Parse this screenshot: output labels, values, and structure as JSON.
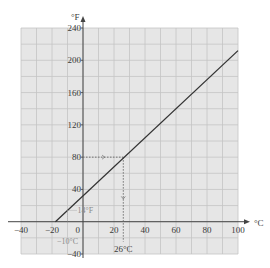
{
  "chart_data": {
    "type": "line",
    "title": "",
    "xlabel": "°C",
    "ylabel": "°F",
    "xlim": [
      -40,
      100
    ],
    "ylim": [
      -40,
      240
    ],
    "grid": true,
    "x_ticks": [
      -40,
      -20,
      0,
      20,
      40,
      60,
      80,
      100
    ],
    "y_ticks": [
      -40,
      40,
      80,
      120,
      160,
      200,
      240
    ],
    "x_tick_labels": [
      "−40",
      "−20",
      "0",
      "20",
      "40",
      "60",
      "80",
      "100"
    ],
    "y_tick_labels": [
      "−40",
      "40",
      "80",
      "120",
      "160",
      "200",
      "240"
    ],
    "series": [
      {
        "name": "Fahrenheit vs Celsius",
        "x": [
          -17.8,
          0,
          26,
          100
        ],
        "y": [
          0,
          32,
          80,
          212
        ]
      }
    ],
    "annotations": [
      {
        "text": "−10°C",
        "x": -10,
        "y": 0
      },
      {
        "text": "14°F",
        "x": -10,
        "y": 14
      },
      {
        "text": "26°C",
        "x": 26,
        "y": 0
      },
      {
        "text": "80",
        "x": 0,
        "y": 80
      }
    ],
    "colors": {
      "grid_bg": "#e6e6e6",
      "grid_line": "#c2c2c2",
      "axis": "#444444",
      "series_line": "#333333",
      "guide": "#666666"
    }
  },
  "labels": {
    "x_unit": "°C",
    "y_unit": "°F",
    "ann_minus10": "−10°C",
    "ann_14f": "14°F",
    "ann_26c": "26°C"
  }
}
